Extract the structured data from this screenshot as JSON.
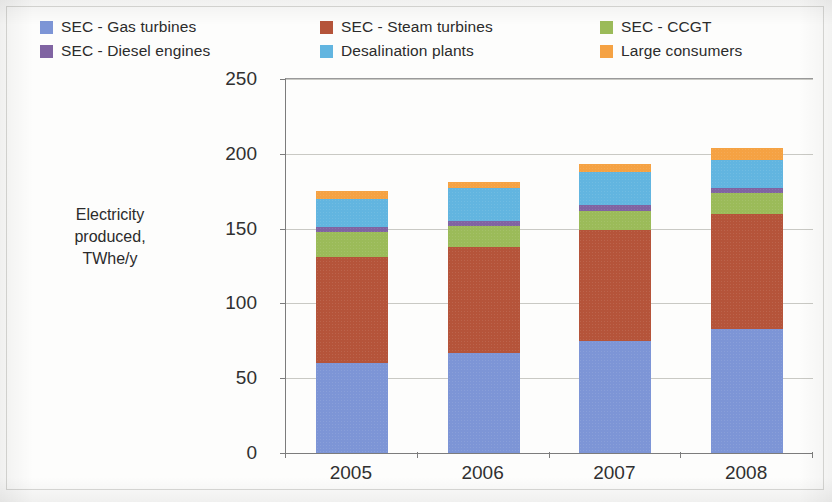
{
  "legend": {
    "items": [
      {
        "label": "SEC - Gas turbines",
        "color": "#7d95d6",
        "icon": "legend-swatch-icon"
      },
      {
        "label": "SEC - Steam turbines",
        "color": "#b5543a",
        "icon": "legend-swatch-icon"
      },
      {
        "label": "SEC - CCGT",
        "color": "#9bbb59",
        "icon": "legend-swatch-icon"
      },
      {
        "label": "SEC - Diesel engines",
        "color": "#8064a2",
        "icon": "legend-swatch-icon"
      },
      {
        "label": "Desalination plants",
        "color": "#62b5e0",
        "icon": "legend-swatch-icon"
      },
      {
        "label": "Large consumers",
        "color": "#f5a243",
        "icon": "legend-swatch-icon"
      }
    ]
  },
  "axis": {
    "y_title_line1": "Electricity",
    "y_title_line2": "produced,",
    "y_title_line3": "TWhe/y",
    "y_ticks": [
      "250",
      "200",
      "150",
      "100",
      "50",
      "0"
    ],
    "x_ticks": [
      "2005",
      "2006",
      "2007",
      "2008"
    ]
  },
  "chart_data": {
    "type": "bar",
    "stacked": true,
    "title": "",
    "xlabel": "",
    "ylabel": "Electricity produced, TWhe/y",
    "ylim": [
      0,
      250
    ],
    "ytick_values": [
      0,
      50,
      100,
      150,
      200,
      250
    ],
    "grid": true,
    "legend_position": "top",
    "categories": [
      "2005",
      "2006",
      "2007",
      "2008"
    ],
    "series": [
      {
        "name": "SEC - Gas turbines",
        "color": "#7d95d6",
        "values": [
          60,
          67,
          75,
          83
        ]
      },
      {
        "name": "SEC - Steam turbines",
        "color": "#b5543a",
        "values": [
          71,
          71,
          74,
          77
        ]
      },
      {
        "name": "SEC - CCGT",
        "color": "#9bbb59",
        "values": [
          17,
          14,
          13,
          14
        ]
      },
      {
        "name": "SEC - Diesel engines",
        "color": "#8064a2",
        "values": [
          3,
          3,
          4,
          3
        ]
      },
      {
        "name": "Desalination plants",
        "color": "#62b5e0",
        "values": [
          19,
          22,
          22,
          19
        ]
      },
      {
        "name": "Large consumers",
        "color": "#f5a243",
        "values": [
          5,
          4,
          5,
          8
        ]
      }
    ],
    "totals": [
      175,
      181,
      193,
      204
    ]
  }
}
